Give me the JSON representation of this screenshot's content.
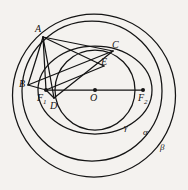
{
  "figure": {
    "kind": "geometry-diagram",
    "background_color": "#f4f2ef",
    "stroke_color": "#141414",
    "canvas": {
      "width": 188,
      "height": 190
    }
  },
  "curves": [
    {
      "name": "beta",
      "label": "β",
      "type": "circle",
      "cx": 94,
      "cy": 95.5,
      "r": 81.5,
      "label_x": 160,
      "label_y": 143
    },
    {
      "name": "alpha",
      "label": "α",
      "type": "circle",
      "cx": 92,
      "cy": 91,
      "r": 70,
      "label_x": 143,
      "label_y": 128
    },
    {
      "name": "gamma",
      "label": "γ",
      "type": "ellipse",
      "cx": 95,
      "cy": 90,
      "rx": 57,
      "ry": 44,
      "label_x": 124,
      "label_y": 123
    },
    {
      "name": "inner-circle",
      "label": "",
      "type": "circle",
      "cx": 95,
      "cy": 90,
      "r": 40,
      "label_x": 0,
      "label_y": 0
    }
  ],
  "points": [
    {
      "id": "A",
      "label": "A",
      "x": 43,
      "y": 37,
      "label_x": 35,
      "label_y": 24,
      "dot": false
    },
    {
      "id": "B",
      "label": "B",
      "x": 28,
      "y": 85,
      "label_x": 19,
      "label_y": 79,
      "dot": false
    },
    {
      "id": "C",
      "label": "C",
      "x": 113,
      "y": 51,
      "label_x": 112,
      "label_y": 40,
      "dot": false
    },
    {
      "id": "D",
      "label": "D",
      "x": 54,
      "y": 98,
      "label_x": 50,
      "label_y": 101,
      "dot": false
    },
    {
      "id": "E",
      "label": "E",
      "x": 104,
      "y": 66,
      "label_x": 101,
      "label_y": 57,
      "dot": false
    },
    {
      "id": "F1",
      "label": "F",
      "sub": "1",
      "x": 46,
      "y": 90,
      "label_x": 37,
      "label_y": 93,
      "dot": true
    },
    {
      "id": "O",
      "label": "O",
      "x": 95,
      "y": 90,
      "label_x": 90,
      "label_y": 93,
      "dot": true
    },
    {
      "id": "F2",
      "label": "F",
      "sub": "2",
      "x": 143,
      "y": 90,
      "label_x": 138,
      "label_y": 93,
      "dot": true
    }
  ],
  "segments": [
    {
      "name": "A-B",
      "from": "A",
      "to": "B"
    },
    {
      "name": "A-F1",
      "from": "A",
      "to": "F1"
    },
    {
      "name": "A-D",
      "from": "A",
      "to": "D"
    },
    {
      "name": "A-C",
      "from": "A",
      "to": "C"
    },
    {
      "name": "A-E",
      "from": "A",
      "to": "E"
    },
    {
      "name": "B-F1",
      "from": "B",
      "to": "F1"
    },
    {
      "name": "B-C",
      "from": "B",
      "to": "C"
    },
    {
      "name": "D-C",
      "from": "D",
      "to": "C"
    },
    {
      "name": "F1-E",
      "from": "F1",
      "to": "E"
    },
    {
      "name": "F1-D",
      "from": "F1",
      "to": "D"
    },
    {
      "name": "F1-F2-axis",
      "from": "F1",
      "to": "F2"
    }
  ]
}
